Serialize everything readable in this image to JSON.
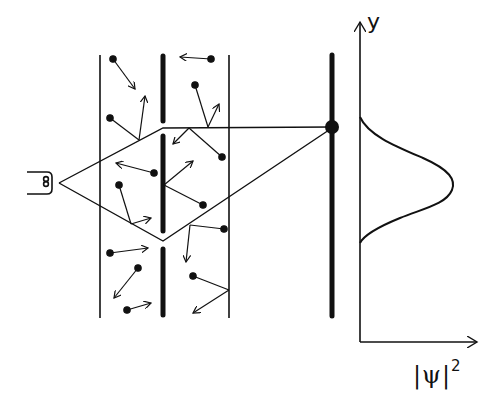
{
  "diagram": {
    "colors": {
      "ink": "#111111",
      "background": "#ffffff"
    },
    "elements": [
      "source (coil / electron gun)",
      "gas region bounded by two walls containing moving particles (dots with velocity arrows)",
      "barrier with two slits",
      "detection screen with detected hit (dot)",
      "probability distribution plot |ψ|² vs y (single Gaussian peak)"
    ],
    "axes": {
      "y_label": "y",
      "x_label": "|ψ|",
      "x_label_exponent": "2"
    },
    "distribution": {
      "shape": "single gaussian",
      "peak_position": "center, aligned with lower slit region",
      "start_y_px": 117,
      "peak_y_px": 185,
      "end_y_px": 243
    }
  }
}
